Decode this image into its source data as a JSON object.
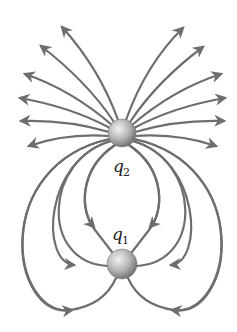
{
  "diagram": {
    "background": "#ffffff",
    "line_color": "#6e6e6e",
    "charges": [
      {
        "id": "q2",
        "label": "q",
        "subscript": "2",
        "cx": 122,
        "cy": 133,
        "r": 14,
        "label_x": 113,
        "label_y": 172,
        "sub_x": 123,
        "sub_y": 176
      },
      {
        "id": "q1",
        "label": "q",
        "subscript": "1",
        "cx": 122,
        "cy": 264,
        "r": 15,
        "label_x": 112,
        "label_y": 240,
        "sub_x": 122,
        "sub_y": 244
      }
    ],
    "outgoing_lines_from_q2": 12,
    "lines_from_q2_to_q1": 8
  }
}
